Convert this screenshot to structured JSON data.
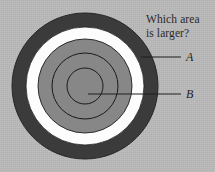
{
  "figure": {
    "kind": "concentric-circles-illusion",
    "background_color": "#b9b9b9",
    "question": {
      "line1": "Which area",
      "line2": "is larger?"
    },
    "labels": {
      "a": "A",
      "b": "B"
    },
    "rings": [
      {
        "name": "outer-dark-ring",
        "label": "A",
        "fill": "#3b3b3b",
        "outer_radius": 73,
        "inner_radius": 59
      },
      {
        "name": "white-ring",
        "label": "",
        "fill": "#fdfdfd",
        "outer_radius": 59,
        "inner_radius": 47
      },
      {
        "name": "gray-disc",
        "label": "B",
        "fill": "#878787",
        "outer_radius": 47,
        "inner_radius": 0
      }
    ],
    "outlines": [
      {
        "name": "middle-outline-circle",
        "radius": 33,
        "stroke": "#1a1a1a"
      },
      {
        "name": "inner-outline-circle",
        "radius": 18,
        "stroke": "#1a1a1a"
      }
    ],
    "center": {
      "cx": 85,
      "cy": 86
    },
    "leaders": [
      {
        "name": "leader-line-a",
        "x1": 141,
        "y1": 57,
        "x2": 181,
        "y2": 57
      },
      {
        "name": "leader-line-b",
        "x1": 88,
        "y1": 94,
        "x2": 181,
        "y2": 94
      }
    ]
  }
}
